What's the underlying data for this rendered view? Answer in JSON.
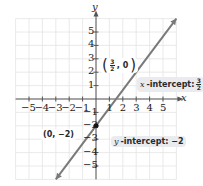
{
  "chart_data": {
    "type": "line",
    "title": "",
    "xlabel": "x",
    "ylabel": "y",
    "xlim": [
      -6,
      6
    ],
    "ylim": [
      -6,
      6
    ],
    "grid": true,
    "x_ticks": [
      -5,
      -4,
      -3,
      -2,
      -1,
      1,
      2,
      3,
      4,
      5
    ],
    "y_ticks": [
      -5,
      -4,
      -3,
      -2,
      -1,
      1,
      2,
      3,
      4,
      5
    ],
    "x_tick_labels": [
      "−5",
      "−4",
      "−3",
      "−2",
      "−1",
      "1",
      "2",
      "3",
      "4",
      "5"
    ],
    "y_tick_labels": [
      "−5",
      "−4",
      "−3",
      "−2",
      "−1",
      "1",
      "2",
      "3",
      "4",
      "5"
    ],
    "series": [
      {
        "name": "y = (4/3)x − 2",
        "slope": 1.3333,
        "intercept": -2,
        "x": [
          -3,
          6
        ],
        "y": [
          -6,
          6
        ],
        "color": "#7a7a7a",
        "arrows": "both"
      }
    ],
    "points": [
      {
        "x": 0,
        "y": -2,
        "label": "(0, −2)",
        "marked": true
      },
      {
        "x": 1.5,
        "y": 0,
        "label": "(3/2, 0)",
        "marked": false
      }
    ],
    "annotations": [
      {
        "text": "x-intercept: 3/2",
        "x": 1.5,
        "y": 0
      },
      {
        "text": "y-intercept: −2",
        "x": 0,
        "y": -2
      }
    ]
  },
  "labels": {
    "axis_x": "x",
    "axis_y": "y",
    "point_x_intercept": {
      "open": "(",
      "num": "3",
      "den": "2",
      "rest": ", 0",
      "close": ")"
    },
    "point_y_intercept": "(0, −2)",
    "x_intercept_prefix_var": "x",
    "x_intercept_prefix_text": "-intercept:",
    "x_intercept_num": "3",
    "x_intercept_den": "2",
    "y_intercept_var": "y",
    "y_intercept_text": "-intercept: −2"
  },
  "colors": {
    "grid": "#e4e4e4",
    "axis": "#555555",
    "line": "#7a7a7a",
    "point": "#111111",
    "bubble": "#e9ebef"
  }
}
